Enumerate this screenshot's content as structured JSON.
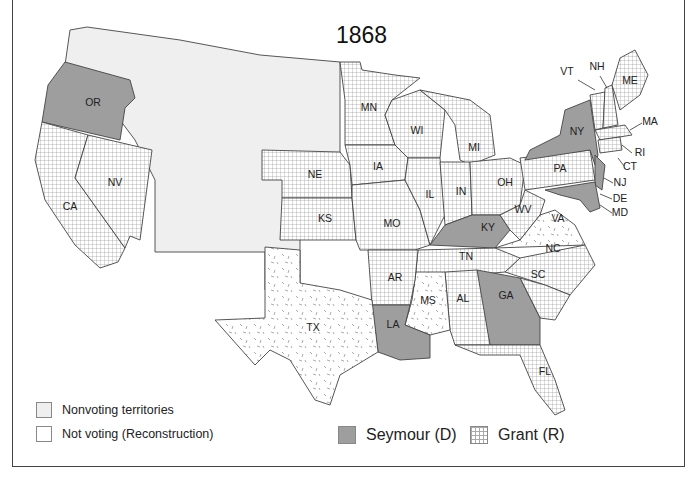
{
  "title": "1868",
  "legend": {
    "nonvoting": "Nonvoting territories",
    "not_voting": "Not voting (Reconstruction)",
    "seymour": "Seymour (D)",
    "grant": "Grant (R)"
  },
  "colors": {
    "territory": "#efefef",
    "seymour": "#9e9e9e",
    "grant_grid": "#aaaaaa",
    "border": "#444444"
  },
  "states": {
    "seymour": [
      "OR",
      "NY",
      "NJ",
      "DE",
      "MD",
      "KY",
      "GA",
      "LA"
    ],
    "grant": [
      "CA",
      "NV",
      "NE",
      "KS",
      "MN",
      "IA",
      "MO",
      "WI",
      "IL",
      "MI",
      "IN",
      "OH",
      "WV",
      "PA",
      "VT",
      "NH",
      "ME",
      "MA",
      "RI",
      "CT",
      "TN",
      "AR",
      "AL",
      "NC",
      "SC",
      "FL"
    ],
    "not_voting": [
      "TX",
      "MS",
      "VA"
    ]
  },
  "labels": {
    "OR": "OR",
    "CA": "CA",
    "NV": "NV",
    "NE": "NE",
    "KS": "KS",
    "MN": "MN",
    "IA": "IA",
    "MO": "MO",
    "WI": "WI",
    "IL": "IL",
    "MI": "MI",
    "IN": "IN",
    "OH": "OH",
    "KY": "KY",
    "WV": "WV",
    "VA": "VA",
    "PA": "PA",
    "NY": "NY",
    "VT": "VT",
    "NH": "NH",
    "ME": "ME",
    "MA": "MA",
    "RI": "RI",
    "CT": "CT",
    "NJ": "NJ",
    "DE": "DE",
    "MD": "MD",
    "NC": "NC",
    "SC": "SC",
    "TN": "TN",
    "GA": "GA",
    "AL": "AL",
    "MS": "MS",
    "AR": "AR",
    "LA": "LA",
    "TX": "TX",
    "FL": "FL"
  }
}
